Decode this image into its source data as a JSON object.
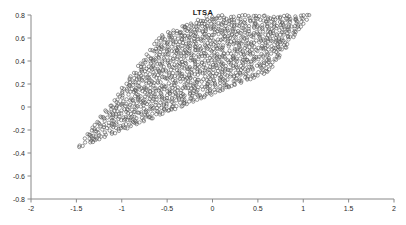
{
  "chart": {
    "title": "LTSA",
    "type": "scatter"
  },
  "chart_data": {
    "type": "scatter",
    "title": "LTSA",
    "xlabel": "",
    "ylabel": "",
    "xlim": [
      -2,
      2
    ],
    "ylim": [
      -0.8,
      0.8
    ],
    "xticks": [
      -2,
      -1.5,
      -1,
      -0.5,
      0,
      0.5,
      1,
      1.5,
      2
    ],
    "xticklabels": [
      "-2",
      "-1.5",
      "-1",
      "-0.5",
      "0",
      "0.5",
      "1",
      "1.5",
      "2"
    ],
    "yticks": [
      -0.8,
      -0.6,
      -0.4,
      -0.2,
      0,
      0.2,
      0.4,
      0.6,
      0.8
    ],
    "yticklabels": [
      "-0.8",
      "-0.6",
      "-0.4",
      "-0.2",
      "0",
      "0.2",
      "0.4",
      "0.6",
      "0.8"
    ],
    "grid": false,
    "legend": null,
    "marker": {
      "style": "open-circle",
      "radius_px": 1.7,
      "color": "#555555",
      "linewidth": 0.6
    },
    "point_count": 1760,
    "cloud_corners": [
      [
        -1.47,
        -0.35
      ],
      [
        -0.55,
        0.63
      ],
      [
        1.52,
        0.3
      ],
      [
        0.55,
        -0.65
      ]
    ],
    "stripe": {
      "count": 44,
      "direction_deg": 42,
      "points_per_stripe": 40
    },
    "series": [
      {
        "name": "embedding",
        "generator": "parallelogram-grid",
        "u_range": [
          0,
          1
        ],
        "v_range": [
          0,
          1
        ],
        "u_steps": 44,
        "v_steps": 40,
        "origin": [
          -1.47,
          -0.35
        ],
        "edge_u": [
          2.07,
          0.65
        ],
        "edge_v": [
          0.92,
          0.98
        ],
        "jitter": [
          0.022,
          0.016
        ],
        "stripe_gap": 0.38
      }
    ]
  }
}
